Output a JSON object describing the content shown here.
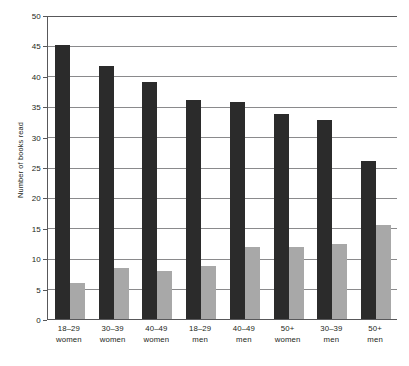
{
  "chart_data": {
    "type": "bar",
    "title": "",
    "subtitle": "",
    "xlabel": "",
    "ylabel": "Number of books read",
    "ylim": [
      0,
      50
    ],
    "ytick_step": 5,
    "yticks": [
      0,
      5,
      10,
      15,
      20,
      25,
      30,
      35,
      40,
      45,
      50
    ],
    "grid": true,
    "grid_axis": "y",
    "legend": "none",
    "orientation": "vertical",
    "categories": [
      "18–29 women",
      "30–39 women",
      "40–49 women",
      "18–29 men",
      "40–49 men",
      "50+ women",
      "30–39 men",
      "50+ men"
    ],
    "category_lines": [
      {
        "line1": "18–29",
        "line2": "women"
      },
      {
        "line1": "30–39",
        "line2": "women"
      },
      {
        "line1": "40–49",
        "line2": "women"
      },
      {
        "line1": "18–29",
        "line2": "men"
      },
      {
        "line1": "40–49",
        "line2": "men"
      },
      {
        "line1": "50+",
        "line2": "women"
      },
      {
        "line1": "30–39",
        "line2": "men"
      },
      {
        "line1": "50+",
        "line2": "men"
      }
    ],
    "series": [
      {
        "name": "dark",
        "color": "#2b2b2b",
        "values": [
          45.0,
          41.6,
          39.0,
          36.0,
          35.7,
          33.8,
          32.8,
          26.0
        ]
      },
      {
        "name": "light",
        "color": "#a8a8a8",
        "values": [
          6.0,
          8.4,
          7.9,
          8.7,
          11.9,
          11.9,
          12.3,
          15.5
        ]
      }
    ]
  },
  "colors": {
    "dark_bar": "#2b2b2b",
    "light_bar": "#a8a8a8",
    "gridline": "#8a8a8c",
    "axis": "#58585a",
    "text": "#231f20",
    "background": "#ffffff"
  }
}
